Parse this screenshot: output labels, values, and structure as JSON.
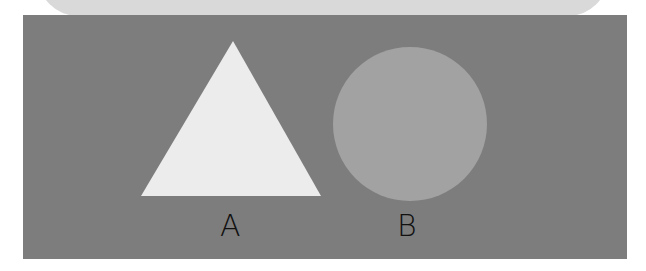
{
  "figure": {
    "shapes": [
      {
        "id": "A",
        "type": "triangle",
        "label": "A",
        "fill": "#ececec"
      },
      {
        "id": "B",
        "type": "circle",
        "label": "B",
        "fill": "#a2a2a2"
      }
    ],
    "colors": {
      "background_panel": "#7d7d7d",
      "top_band": "#d9d9d9",
      "label_text": "#111111"
    }
  }
}
